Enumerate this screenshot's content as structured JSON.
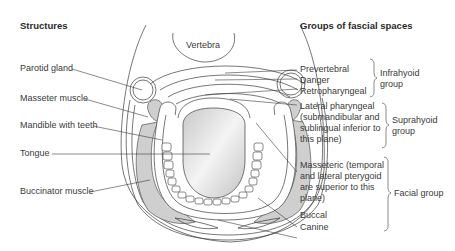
{
  "headings": {
    "left": "Structures",
    "right": "Groups of fascial spaces"
  },
  "diagram": {
    "center_label": "Vertebra",
    "colors": {
      "line": "#3c3c3c",
      "muscle_fill": "#cfcfcf",
      "tongue_fill": "#d6d6d6",
      "background": "#ffffff"
    }
  },
  "structures": [
    {
      "label": "Parotid gland"
    },
    {
      "label": "Masseter muscle"
    },
    {
      "label": "Mandible with teeth"
    },
    {
      "label": "Tongue"
    },
    {
      "label": "Buccinator muscle"
    }
  ],
  "spaces": [
    {
      "label": "Prevertebral"
    },
    {
      "label": "Danger"
    },
    {
      "label": "Retropharyngeal"
    },
    {
      "label": "Lateral pharyngeal\n(submandibular and\nsublingual inferior to\nthis plane)"
    },
    {
      "label": "Masseteric (temporal\nand lateral pterygoid\nare superior to this\nplane)"
    },
    {
      "label": "Buccal"
    },
    {
      "label": "Canine"
    }
  ],
  "groups": [
    {
      "label": "Infrahyoid\ngroup"
    },
    {
      "label": "Suprahyoid\ngroup"
    },
    {
      "label": "Facial group"
    }
  ]
}
